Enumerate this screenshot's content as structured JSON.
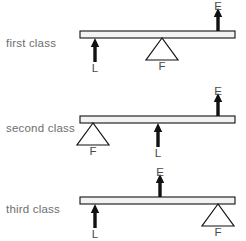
{
  "figure": {
    "width": 246,
    "height": 241,
    "background_color": "#ffffff",
    "ink_color": "#111111",
    "label_color": "#6e6e6e"
  },
  "legend_keys": {
    "effort": "E",
    "load": "L",
    "fulcrum": "F"
  },
  "rows": [
    {
      "label": "first class",
      "label_x": 6,
      "label_y": 37,
      "bar": {
        "x": 80,
        "y": 31,
        "width": 155,
        "height": 7
      },
      "markers": [
        {
          "name": "load",
          "symbol": "L",
          "kind": "arrow",
          "direction": "down",
          "x": 95,
          "top": 38,
          "length": 24,
          "label_x": 95,
          "label_y": 62
        },
        {
          "name": "fulcrum",
          "symbol": "F",
          "kind": "triangle",
          "x": 162,
          "top": 38,
          "height": 22,
          "half_width": 16,
          "label_x": 162,
          "label_y": 60
        },
        {
          "name": "effort",
          "symbol": "E",
          "kind": "arrow",
          "direction": "up",
          "x": 218,
          "top": 8,
          "length": 23,
          "label_x": 218,
          "label_y": 0
        }
      ]
    },
    {
      "label": "second class",
      "label_x": 6,
      "label_y": 122,
      "bar": {
        "x": 80,
        "y": 116,
        "width": 155,
        "height": 7
      },
      "markers": [
        {
          "name": "fulcrum",
          "symbol": "F",
          "kind": "triangle",
          "x": 93,
          "top": 123,
          "height": 22,
          "half_width": 16,
          "label_x": 93,
          "label_y": 145
        },
        {
          "name": "load",
          "symbol": "L",
          "kind": "arrow",
          "direction": "down",
          "x": 158,
          "top": 123,
          "length": 24,
          "label_x": 158,
          "label_y": 147
        },
        {
          "name": "effort",
          "symbol": "E",
          "kind": "arrow",
          "direction": "up",
          "x": 218,
          "top": 93,
          "length": 23,
          "label_x": 218,
          "label_y": 85
        }
      ]
    },
    {
      "label": "third class",
      "label_x": 6,
      "label_y": 203,
      "bar": {
        "x": 80,
        "y": 197,
        "width": 155,
        "height": 7
      },
      "markers": [
        {
          "name": "load",
          "symbol": "L",
          "kind": "arrow",
          "direction": "down",
          "x": 95,
          "top": 204,
          "length": 24,
          "label_x": 95,
          "label_y": 228
        },
        {
          "name": "effort",
          "symbol": "E",
          "kind": "arrow",
          "direction": "up",
          "x": 160,
          "top": 174,
          "length": 23,
          "label_x": 160,
          "label_y": 166
        },
        {
          "name": "fulcrum",
          "symbol": "F",
          "kind": "triangle",
          "x": 218,
          "top": 204,
          "height": 22,
          "half_width": 16,
          "label_x": 218,
          "label_y": 226
        }
      ]
    }
  ]
}
